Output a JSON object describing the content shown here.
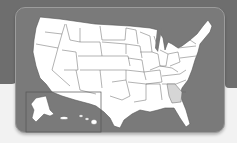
{
  "map": {
    "title": "United States map",
    "highlighted_state": "Georgia",
    "colors": {
      "background_band": "#6e6e6e",
      "panel": "#7a7a7a",
      "state_fill": "#ffffff",
      "highlight_fill": "#d6d6d6",
      "border": "#555555"
    },
    "inset": {
      "states": [
        "Alaska",
        "Hawaii"
      ]
    }
  }
}
